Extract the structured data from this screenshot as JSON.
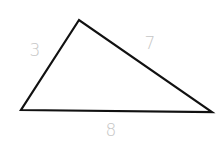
{
  "diagram": {
    "type": "triangle",
    "background": "#ffffff",
    "stroke_color": "#111111",
    "stroke_width": 2.2,
    "label_color": "#c6c6c6",
    "vertices": {
      "top": {
        "x": 79,
        "y": 20
      },
      "bottom_left": {
        "x": 21,
        "y": 110
      },
      "bottom_right": {
        "x": 212,
        "y": 112
      }
    },
    "sides": [
      {
        "name": "left",
        "label": "3",
        "label_x": 35,
        "label_y": 56
      },
      {
        "name": "right",
        "label": "7",
        "label_x": 150,
        "label_y": 49
      },
      {
        "name": "bottom",
        "label": "8",
        "label_x": 111,
        "label_y": 136
      }
    ]
  }
}
